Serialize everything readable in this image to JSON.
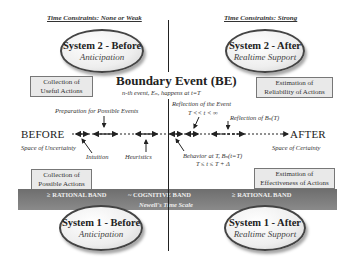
{
  "headers": {
    "left": "Time Constraints: None or Weak",
    "right": "Time Constraints: Strong"
  },
  "ovals": {
    "top_left": {
      "title": "System 2 - Before",
      "subtitle": "Anticipation"
    },
    "top_right": {
      "title": "System 2 - After",
      "subtitle": "Realtime Support"
    },
    "bottom_left": {
      "title": "System 1 - Before",
      "subtitle": "Anticipation"
    },
    "bottom_right": {
      "title": "System 1 - After",
      "subtitle": "Realtime Support"
    }
  },
  "boxes": {
    "top_left": {
      "line1": "Collection of",
      "line2": "Useful Actions"
    },
    "top_right": {
      "line1": "Estimation of",
      "line2": "Reliability of Actions"
    },
    "bottom_left": {
      "line1": "Collection of",
      "line2": "Possible Actions"
    },
    "bottom_right": {
      "line1": "Estimation of",
      "line2": "Effectiveness of Actions"
    }
  },
  "boundary": {
    "title": "Boundary Event (BE)",
    "subtitle": "n-th event, Eₙ, happens at t=T"
  },
  "timeline": {
    "before_label": "BEFORE",
    "after_label": "AFTER",
    "before_sub": "Space of Uncertainty",
    "after_sub": "Space of Certainty"
  },
  "annotations": {
    "preparation": "Preparation for Possible Events",
    "intuition": "Intuition",
    "heuristics": "Heuristics",
    "reflection_event": "Reflection of the Event",
    "reflection_event_range": "T << t < ∞",
    "reflection_bn": "Reflection of Bₙ(T)",
    "behavior": "Behavior at T, Bₙ(t=T)",
    "behavior_range": "T ≤ t ≤ T + Δ"
  },
  "band": {
    "left": "≥ RATIONAL BAND",
    "center": "~ COGNITIVE BAND",
    "right": "≥ RATIONAL BAND",
    "caption": "Newell's Time Scale"
  },
  "colors": {
    "band": "#777777",
    "box": "#e9e9e9",
    "line": "#222222"
  }
}
